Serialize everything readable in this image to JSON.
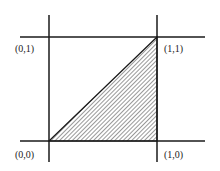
{
  "diagram": {
    "type": "unit-square-region",
    "lines": {
      "vertical": [
        {
          "x": 49,
          "y1": 15,
          "y2": 162
        },
        {
          "x": 157,
          "y1": 15,
          "y2": 162
        }
      ],
      "horizontal": [
        {
          "y": 37,
          "x1": 20,
          "x2": 205
        },
        {
          "y": 141,
          "x1": 20,
          "x2": 205
        }
      ]
    },
    "shaded_region": {
      "shape": "triangle",
      "vertices": [
        "(0,0)",
        "(1,0)",
        "(1,1)"
      ],
      "fill": "diagonal-hatch"
    },
    "labels": {
      "top_left": "(0,1)",
      "top_right": "(1,1)",
      "bottom_left": "(0,0)",
      "bottom_right": "(1,0)"
    },
    "colors": {
      "line": "#1a1a1a",
      "hatch": "#333333",
      "background": "#ffffff"
    }
  }
}
